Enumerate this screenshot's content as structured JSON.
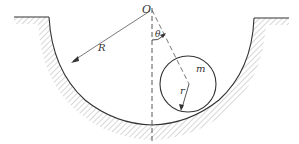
{
  "diagram": {
    "labels": {
      "center": "O",
      "big_radius": "R",
      "angle": "θ",
      "mass": "m",
      "small_radius": "r"
    },
    "colors": {
      "line": "#333333",
      "hatch": "#aaaaaa",
      "background": "#ffffff"
    }
  }
}
